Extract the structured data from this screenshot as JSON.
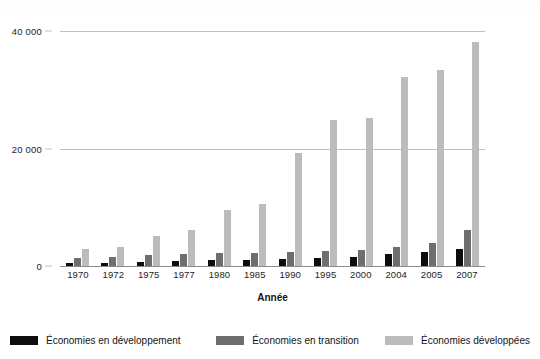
{
  "chart_data": {
    "type": "bar",
    "title": "",
    "xlabel": "Année",
    "ylabel": "",
    "ylim": [
      0,
      40000
    ],
    "yticks": [
      0,
      20000,
      40000
    ],
    "ytick_labels": [
      "0",
      "20 000",
      "40 000"
    ],
    "grid": true,
    "legend_position": "bottom",
    "categories": [
      "1970",
      "1972",
      "1975",
      "1977",
      "1980",
      "1985",
      "1990",
      "1995",
      "2000",
      "2004",
      "2005",
      "2007"
    ],
    "series": [
      {
        "name": "Économies en développement",
        "color": "#0d0d0d",
        "values": [
          550,
          600,
          750,
          850,
          1000,
          1100,
          1200,
          1400,
          1600,
          2100,
          2400,
          2900
        ]
      },
      {
        "name": "Économies en transition",
        "color": "#6e6e6e",
        "values": [
          1400,
          1500,
          1800,
          2000,
          2200,
          2300,
          2400,
          2500,
          2700,
          3300,
          4000,
          6200
        ]
      },
      {
        "name": "Économies développées",
        "color": "#bcbcbc",
        "values": [
          2900,
          3300,
          5100,
          6200,
          9600,
          10600,
          19200,
          24900,
          25200,
          32100,
          33300,
          38100
        ]
      }
    ]
  },
  "axis": {
    "x_title": "Année"
  },
  "legend": {
    "items": [
      {
        "label": "Économies en développement",
        "swatch": "legend-swatch-black"
      },
      {
        "label": "Économies en transition",
        "swatch": "legend-swatch-darkgray"
      },
      {
        "label": "Économies développées",
        "swatch": "legend-swatch-lightgray"
      }
    ]
  }
}
